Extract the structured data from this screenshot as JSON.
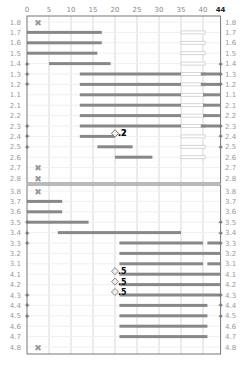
{
  "chart_data": {
    "type": "bar",
    "subtype": "dental-chart-range-bars",
    "title": "",
    "x_axis": {
      "min": 0,
      "max": 44,
      "ticks": [
        0,
        5,
        10,
        15,
        20,
        25,
        30,
        35,
        40
      ],
      "end_label": "44",
      "position": "top"
    },
    "grid": true,
    "panels": [
      {
        "name": "upper",
        "rows": [
          {
            "label": "1.8",
            "missing": true
          },
          {
            "label": "1.7",
            "bar": [
              0,
              17
            ],
            "ghost": [
              35,
              40.5
            ]
          },
          {
            "label": "1.6",
            "bar": [
              0,
              17
            ],
            "ghost": [
              35,
              40.5
            ]
          },
          {
            "label": "1.5",
            "bar": [
              0,
              16
            ],
            "ghost": [
              35,
              40.5
            ]
          },
          {
            "label": "1.4",
            "bar": [
              5,
              19
            ],
            "ghost": [
              35,
              40.5
            ],
            "left_marker": true,
            "right_marker": true
          },
          {
            "label": "1.3",
            "bar": [
              12,
              35
            ],
            "right_bar": [
              39.5,
              44
            ],
            "ghost": [
              35,
              40.5
            ],
            "left_marker": true,
            "right_marker": true
          },
          {
            "label": "1.2",
            "bar": [
              12,
              35
            ],
            "right_bar": [
              39.5,
              44
            ],
            "ghost": [
              35,
              40.5
            ],
            "left_marker": true,
            "right_marker": true
          },
          {
            "label": "1.1",
            "bar": [
              12,
              35
            ],
            "right_bar": [
              40,
              44
            ],
            "ghost": [
              35,
              40.5
            ]
          },
          {
            "label": "2.1",
            "bar": [
              12,
              35
            ],
            "right_bar": [
              40,
              44
            ],
            "ghost": [
              35,
              40.5
            ]
          },
          {
            "label": "2.2",
            "bar": [
              12,
              35
            ],
            "right_bar": [
              40,
              44
            ],
            "ghost": [
              35,
              40.5
            ]
          },
          {
            "label": "2.3",
            "bar": [
              12,
              35
            ],
            "right_bar": [
              39.5,
              44
            ],
            "ghost": [
              35,
              40.5
            ],
            "left_marker": true,
            "right_marker": true
          },
          {
            "label": "2.4",
            "bar": [
              12,
              20
            ],
            "ghost": [
              35,
              40.5
            ],
            "left_marker": true,
            "right_marker": true,
            "point": {
              "x": 20,
              "label": "2"
            }
          },
          {
            "label": "2.5",
            "bar": [
              16,
              24
            ],
            "ghost": [
              35,
              40.5
            ],
            "left_marker": true,
            "right_marker": true,
            "point": {
              "x": 20,
              "label": "2"
            },
            "point_row_offset": -1
          },
          {
            "label": "2.6",
            "bar": [
              20,
              28.5
            ],
            "ghost": [
              35,
              40.5
            ]
          },
          {
            "label": "2.7",
            "missing": true
          },
          {
            "label": "2.8",
            "missing": true
          }
        ]
      },
      {
        "name": "lower",
        "rows": [
          {
            "label": "3.8",
            "missing": true
          },
          {
            "label": "3.7",
            "bar": [
              0,
              8
            ]
          },
          {
            "label": "3.6",
            "bar": [
              0,
              8
            ]
          },
          {
            "label": "3.5",
            "bar": [
              0,
              14
            ],
            "left_marker": true,
            "right_marker": true
          },
          {
            "label": "3.4",
            "bar": [
              7,
              35
            ],
            "left_marker": true,
            "right_marker": true
          },
          {
            "label": "3.3",
            "bar": [
              21,
              40
            ],
            "right_bar": [
              41,
              44
            ],
            "left_marker": true,
            "right_marker": true
          },
          {
            "label": "3.2",
            "bar": [
              21,
              44
            ]
          },
          {
            "label": "3.1",
            "bar": [
              21,
              40
            ],
            "right_bar": [
              41,
              44
            ]
          },
          {
            "label": "4.1",
            "bar": [
              21,
              44
            ],
            "point": {
              "x": 20,
              "label": "5"
            }
          },
          {
            "label": "4.2",
            "bar": [
              21,
              44
            ],
            "point": {
              "x": 20,
              "label": "5"
            }
          },
          {
            "label": "4.3",
            "bar": [
              21,
              44
            ],
            "left_marker": true,
            "right_marker": true,
            "point": {
              "x": 20,
              "label": "5"
            }
          },
          {
            "label": "4.4",
            "bar": [
              21,
              41
            ],
            "left_marker": true,
            "right_marker": true
          },
          {
            "label": "4.5",
            "bar": [
              21,
              41
            ],
            "left_marker": true,
            "right_marker": true
          },
          {
            "label": "4.6",
            "bar": [
              21,
              41
            ]
          },
          {
            "label": "4.7",
            "bar": [
              21,
              41
            ]
          },
          {
            "label": "4.8",
            "missing": true
          }
        ]
      }
    ],
    "annotations": [
      "2",
      "2",
      "5",
      "5",
      "5"
    ]
  },
  "colors": {
    "bar": "#888888",
    "ghost": "#cccccc",
    "grid": "#d8d8d8",
    "frame": "#777777",
    "missing": "#999999",
    "label": "#999999"
  }
}
